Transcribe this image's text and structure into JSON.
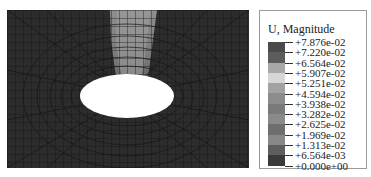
{
  "figure": {
    "type": "finite-element contour plot",
    "colors": {
      "background_mesh": "#2a2a2a",
      "mesh_lines": "#111111",
      "hole": "#ffffff",
      "high_band": "#9a9a9a"
    }
  },
  "legend": {
    "title": "U, Magnitude",
    "levels": [
      {
        "label": "+7.876e-02",
        "color": "#4a4a4a"
      },
      {
        "label": "+7.220e-02",
        "color": "#5c5c5c"
      },
      {
        "label": "+6.564e-02",
        "color": "#a8a8a8"
      },
      {
        "label": "+5.907e-02",
        "color": "#d6d6d6"
      },
      {
        "label": "+5.251e-02",
        "color": "#a2a2a2"
      },
      {
        "label": "+4.594e-02",
        "color": "#8c8c8c"
      },
      {
        "label": "+3.938e-02",
        "color": "#7a7a7a"
      },
      {
        "label": "+3.282e-02",
        "color": "#8a8a8a"
      },
      {
        "label": "+2.625e-02",
        "color": "#6e6e6e"
      },
      {
        "label": "+1.969e-02",
        "color": "#888888"
      },
      {
        "label": "+1.313e-02",
        "color": "#5e5e5e"
      },
      {
        "label": "+6.564e-03",
        "color": "#3a3a3a"
      },
      {
        "label": "+0.000e+00",
        "color": "#2e2e2e"
      }
    ]
  }
}
